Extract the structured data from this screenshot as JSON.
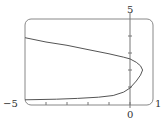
{
  "chart_data": {
    "type": "line",
    "title": "",
    "xlabel": "",
    "ylabel": "",
    "xlim": [
      -5,
      1
    ],
    "ylim": [
      0,
      5
    ],
    "grid": false,
    "legend": null,
    "x_tick_labels": [
      "−5",
      "0",
      "1"
    ],
    "y_tick_labels": [
      "5"
    ],
    "x_ticks": [
      -4,
      -3,
      -2,
      -1,
      0
    ],
    "y_ticks": [
      1,
      2,
      3,
      4
    ],
    "series": [
      {
        "name": "curve",
        "points": [
          [
            -5.0,
            3.9
          ],
          [
            -4.0,
            3.65
          ],
          [
            -3.0,
            3.45
          ],
          [
            -2.0,
            3.2
          ],
          [
            -1.0,
            2.95
          ],
          [
            -0.3,
            2.75
          ],
          [
            0.0,
            2.65
          ],
          [
            0.3,
            2.45
          ],
          [
            0.5,
            2.25
          ],
          [
            0.6,
            2.0
          ],
          [
            0.5,
            1.7
          ],
          [
            0.3,
            1.35
          ],
          [
            0.0,
            0.94
          ],
          [
            -0.3,
            0.7
          ],
          [
            -0.8,
            0.5
          ],
          [
            -1.5,
            0.4
          ],
          [
            -2.5,
            0.33
          ],
          [
            -3.5,
            0.28
          ],
          [
            -5.0,
            0.25
          ]
        ]
      }
    ]
  },
  "labels": {
    "x_min": "−5",
    "x_zero": "0",
    "x_max": "1",
    "y_max": "5"
  },
  "colors": {
    "frame": "#888888",
    "axis": "#777777",
    "curve": "#555555",
    "text": "#333333"
  }
}
